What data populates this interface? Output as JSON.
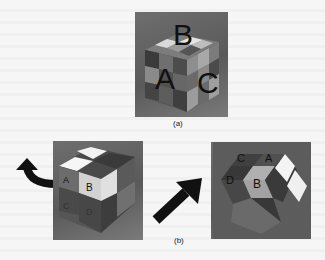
{
  "figure": {
    "panel_a": {
      "caption": "(a)",
      "face_labels": {
        "top": "B",
        "left": "A",
        "right": "C"
      }
    },
    "panel_b": {
      "caption": "(b)",
      "left_cube": {
        "face_labels": {
          "front_left_top": "A",
          "front_right_top": "B",
          "front_left_bottom": "C",
          "front_right_bottom": "D"
        }
      },
      "right_cube": {
        "face_labels": {
          "top_left": "C",
          "top_right": "A",
          "mid_left": "D",
          "mid_right": "B"
        }
      },
      "arrows": [
        {
          "name": "curved-rotate-arrow",
          "direction": "up-left"
        },
        {
          "name": "diagonal-arrow",
          "direction": "up-right"
        }
      ]
    },
    "colors": {
      "background": "#f6f6f6",
      "photo_bg": "#626262",
      "sticker_dark": "#3e3e3e",
      "sticker_mid": "#6a6a6a",
      "sticker_light": "#a9a9a9",
      "sticker_white": "#f4f4f4",
      "arrow": "#111111"
    }
  }
}
